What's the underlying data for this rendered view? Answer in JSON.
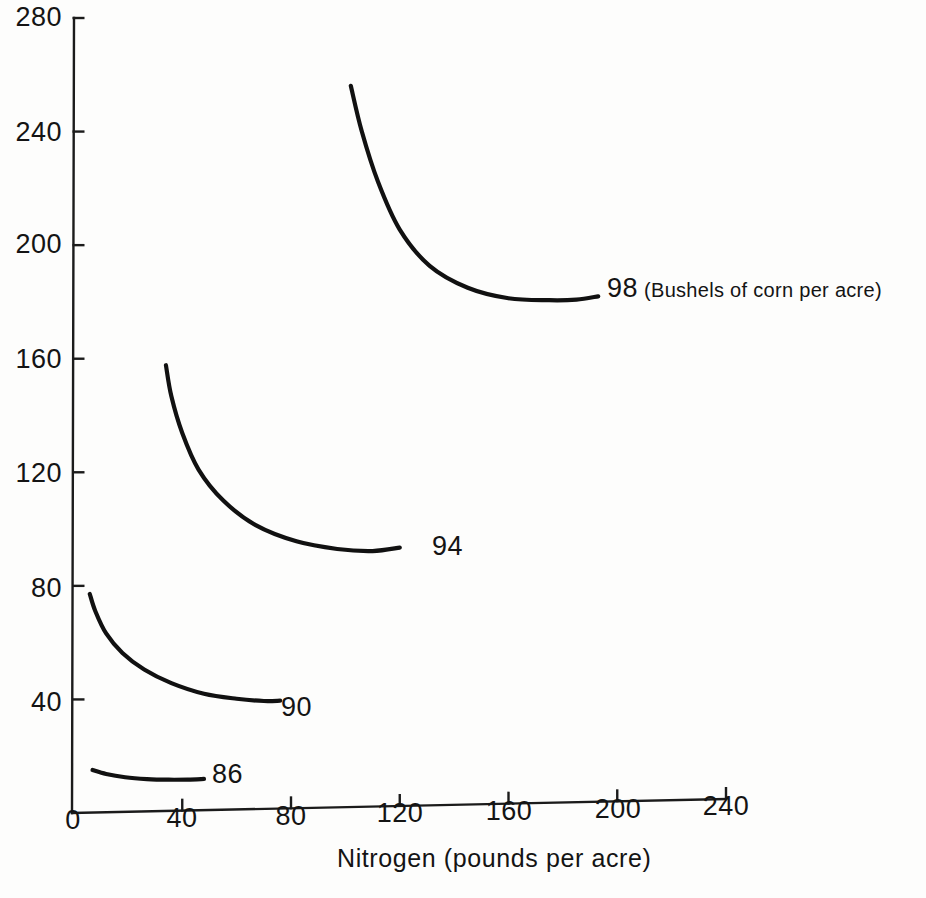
{
  "chart_data": {
    "type": "line",
    "title": "",
    "subtitle": "",
    "xlabel": "Nitrogen (pounds per acre)",
    "ylabel": "",
    "xlim": [
      0,
      240
    ],
    "ylim": [
      0,
      280
    ],
    "xticks": [
      "0",
      "40",
      "80",
      "120",
      "160",
      "200",
      "240"
    ],
    "yticks": [
      "40",
      "80",
      "120",
      "160",
      "200",
      "240",
      "280"
    ],
    "grid": false,
    "legend_position": "inline-right-of-curve",
    "value_units": "Bushels of corn per acre",
    "series": [
      {
        "name": "98",
        "label": "98",
        "units_note": "(Bushels of corn per acre)",
        "x": [
          102,
          106,
          112,
          120,
          131,
          145,
          160,
          175,
          185,
          193
        ],
        "y": [
          254,
          238,
          220,
          203,
          190,
          182,
          178,
          177,
          177,
          178
        ]
      },
      {
        "name": "94",
        "label": "94",
        "units_note": "",
        "x": [
          34,
          36,
          40,
          46,
          55,
          67,
          82,
          97,
          110,
          120
        ],
        "y": [
          157,
          146,
          133,
          120,
          109,
          100,
          94,
          91,
          90,
          91
        ]
      },
      {
        "name": "90",
        "label": "90",
        "units_note": "",
        "x": [
          6,
          8,
          12,
          18,
          26,
          36,
          48,
          60,
          70,
          76
        ],
        "y": [
          77,
          71,
          63,
          56,
          50,
          45,
          41,
          39,
          38,
          38
        ]
      },
      {
        "name": "86",
        "label": "86",
        "units_note": "",
        "x": [
          7,
          12,
          19,
          27,
          35,
          42,
          48
        ],
        "y": [
          15,
          13.5,
          12.2,
          11.4,
          11.0,
          10.9,
          11.0
        ]
      }
    ],
    "colors": {
      "curve": "#111111",
      "axis": "#1b1b1b",
      "background": "#fdfdfc"
    }
  },
  "axes": {
    "y_tick_labels": [
      {
        "text": "280",
        "top": 4,
        "right": 62
      },
      {
        "text": "240",
        "top": 119,
        "right": 62
      },
      {
        "text": "200",
        "top": 231,
        "right": 62
      },
      {
        "text": "160",
        "top": 346,
        "right": 62
      },
      {
        "text": "120",
        "top": 460,
        "right": 62
      },
      {
        "text": "80",
        "top": 575,
        "right": 62
      },
      {
        "text": "40",
        "top": 689,
        "right": 62
      }
    ],
    "x_tick_labels": [
      {
        "text": "0",
        "left": 73
      },
      {
        "text": "40",
        "left": 182
      },
      {
        "text": "80",
        "left": 291
      },
      {
        "text": "120",
        "left": 400
      },
      {
        "text": "160",
        "left": 509
      },
      {
        "text": "200",
        "left": 618
      },
      {
        "text": "240",
        "left": 726
      }
    ],
    "x_axis_title": "Nitrogen (pounds per acre)"
  },
  "curve_labels": [
    {
      "text": "98",
      "units": "(Bushels of corn per acre)",
      "left": 607,
      "top": 275
    },
    {
      "text": "94",
      "units": "",
      "left": 432,
      "top": 533
    },
    {
      "text": "90",
      "units": "",
      "left": 281,
      "top": 694
    },
    {
      "text": "86",
      "units": "",
      "left": 212,
      "top": 761
    }
  ]
}
